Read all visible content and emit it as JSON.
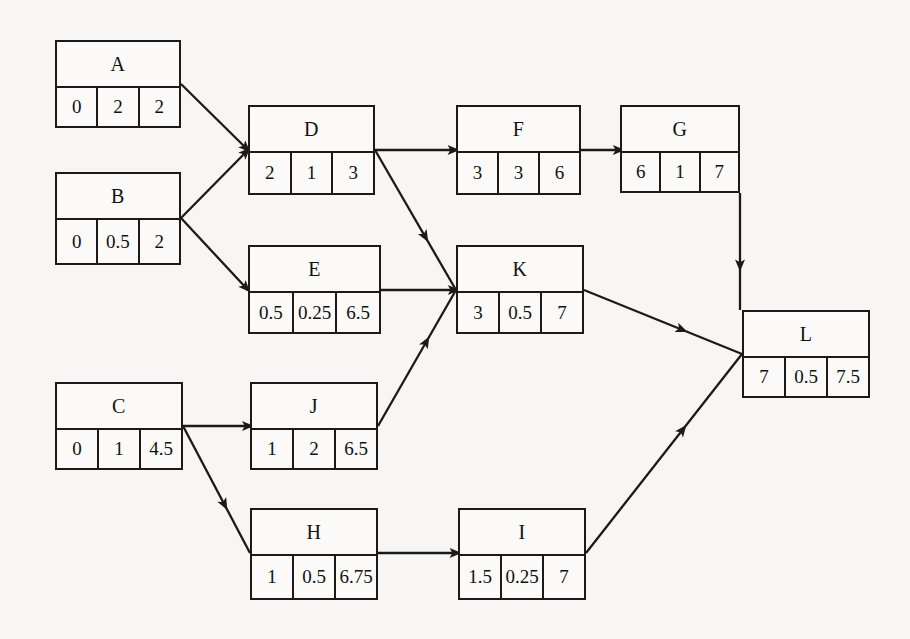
{
  "diagram": {
    "background_color": "#f7f6f4",
    "line_color": "#1a1a1a",
    "node_fill_color": "#fbfaf8",
    "cell_headers": [
      "earliest start",
      "duration",
      "earliest finish"
    ]
  },
  "nodes": [
    {
      "id": "A",
      "label": "A",
      "cells": [
        "0",
        "2",
        "2"
      ],
      "x": 55,
      "y": 40,
      "w": 126,
      "h": 88
    },
    {
      "id": "B",
      "label": "B",
      "cells": [
        "0",
        "0.5",
        "2"
      ],
      "x": 55,
      "y": 172,
      "w": 126,
      "h": 93
    },
    {
      "id": "C",
      "label": "C",
      "cells": [
        "0",
        "1",
        "4.5"
      ],
      "x": 55,
      "y": 382,
      "w": 128,
      "h": 88
    },
    {
      "id": "D",
      "label": "D",
      "cells": [
        "2",
        "1",
        "3"
      ],
      "x": 248,
      "y": 105,
      "w": 127,
      "h": 90
    },
    {
      "id": "E",
      "label": "E",
      "cells": [
        "0.5",
        "0.25",
        "6.5"
      ],
      "x": 248,
      "y": 245,
      "w": 133,
      "h": 89
    },
    {
      "id": "F",
      "label": "F",
      "cells": [
        "3",
        "3",
        "6"
      ],
      "x": 456,
      "y": 105,
      "w": 125,
      "h": 90
    },
    {
      "id": "G",
      "label": "G",
      "cells": [
        "6",
        "1",
        "7"
      ],
      "x": 620,
      "y": 105,
      "w": 120,
      "h": 88
    },
    {
      "id": "J",
      "label": "J",
      "cells": [
        "1",
        "2",
        "6.5"
      ],
      "x": 250,
      "y": 382,
      "w": 128,
      "h": 88
    },
    {
      "id": "K",
      "label": "K",
      "cells": [
        "3",
        "0.5",
        "7"
      ],
      "x": 456,
      "y": 245,
      "w": 128,
      "h": 89
    },
    {
      "id": "H",
      "label": "H",
      "cells": [
        "1",
        "0.5",
        "6.75"
      ],
      "x": 250,
      "y": 508,
      "w": 128,
      "h": 92
    },
    {
      "id": "I",
      "label": "I",
      "cells": [
        "1.5",
        "0.25",
        "7"
      ],
      "x": 458,
      "y": 508,
      "w": 128,
      "h": 92
    },
    {
      "id": "L",
      "label": "L",
      "cells": [
        "7",
        "0.5",
        "7.5"
      ],
      "x": 742,
      "y": 310,
      "w": 128,
      "h": 88
    }
  ],
  "edges": [
    {
      "id": "A-D",
      "from": "A",
      "to": "D",
      "points": "181,84 248,150"
    },
    {
      "id": "B-D",
      "from": "B",
      "to": "D",
      "points": "181,218 248,150"
    },
    {
      "id": "B-E",
      "from": "B",
      "to": "E",
      "points": "181,218 248,290"
    },
    {
      "id": "D-F",
      "from": "D",
      "to": "F",
      "points": "375,150 456,150"
    },
    {
      "id": "D-K",
      "from": "D",
      "to": "K",
      "points": "375,150 456,290"
    },
    {
      "id": "E-K",
      "from": "E",
      "to": "K",
      "points": "381,290 456,290"
    },
    {
      "id": "F-G",
      "from": "F",
      "to": "G",
      "points": "581,150 620,150"
    },
    {
      "id": "G-L",
      "from": "G",
      "to": "L",
      "points": "740,193 740,310"
    },
    {
      "id": "C-J",
      "from": "C",
      "to": "J",
      "points": "183,426 250,426"
    },
    {
      "id": "C-H",
      "from": "C",
      "to": "H",
      "points": "183,426 250,553"
    },
    {
      "id": "J-K",
      "from": "J",
      "to": "K",
      "points": "378,426 456,290"
    },
    {
      "id": "K-L",
      "from": "K",
      "to": "L",
      "points": "584,290 742,354"
    },
    {
      "id": "H-I",
      "from": "H",
      "to": "I",
      "points": "378,553 458,553"
    },
    {
      "id": "I-L",
      "from": "I",
      "to": "L",
      "points": "586,553 742,354"
    }
  ]
}
